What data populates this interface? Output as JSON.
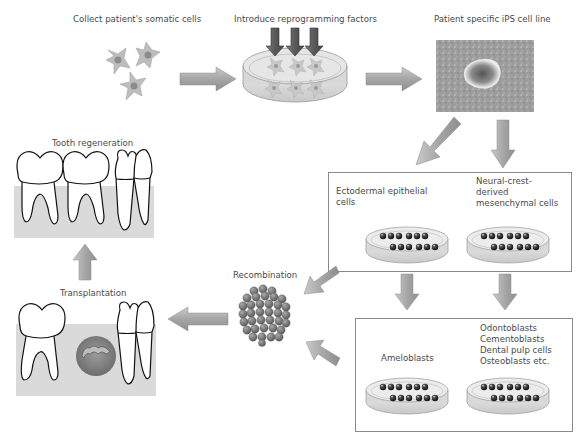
{
  "diagram": {
    "steps": {
      "collect": {
        "label": "Collect patient's somatic cells"
      },
      "reprogram": {
        "label": "Introduce reprogramming factors"
      },
      "ips": {
        "label": "Patient specific iPS cell line"
      },
      "ectodermal": {
        "label": "Ectodermal epithelial\ncells"
      },
      "neural_crest": {
        "label": "Neural-crest-\nderived\nmesenchymal cells"
      },
      "ameloblasts": {
        "label": "Ameloblasts"
      },
      "odontoblasts": {
        "label": "Odontoblasts\nCementoblasts\nDental pulp cells\nOsteoblasts etc."
      },
      "recombination": {
        "label": "Recombination"
      },
      "transplantation": {
        "label": "Transplantation"
      },
      "tooth_regeneration": {
        "label": "Tooth regeneration"
      }
    },
    "flow": [
      {
        "from": "collect",
        "to": "reprogram"
      },
      {
        "from": "reprogram",
        "to": "ips"
      },
      {
        "from": "ips",
        "to": "ectodermal"
      },
      {
        "from": "ips",
        "to": "neural_crest"
      },
      {
        "from": "ectodermal",
        "to": "ameloblasts"
      },
      {
        "from": "neural_crest",
        "to": "odontoblasts"
      },
      {
        "from": "differentiated_box_top",
        "to": "recombination"
      },
      {
        "from": "differentiated_box_bottom",
        "to": "recombination"
      },
      {
        "from": "recombination",
        "to": "transplantation"
      },
      {
        "from": "transplantation",
        "to": "tooth_regeneration"
      }
    ],
    "colors": {
      "arrow_fill": "#9a9a9a",
      "arrow_highlight": "#c4c4c4",
      "gum": "#d9d9d9",
      "cell": "#8c8c8c",
      "dish": "#d6d6d6",
      "tooth_germ": "#8e8e8e",
      "box_border": "#8a8a8a"
    }
  }
}
